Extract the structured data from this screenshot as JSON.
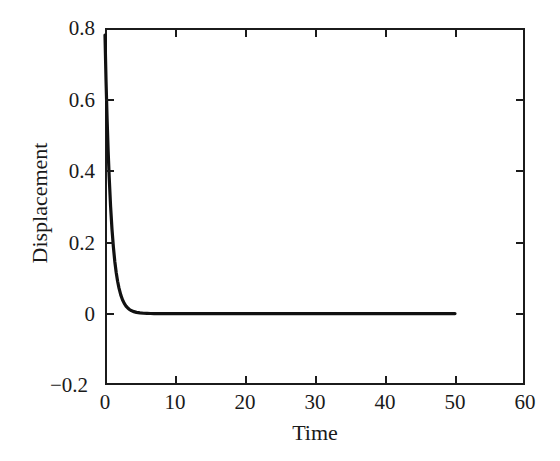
{
  "chart_data": {
    "type": "line",
    "title": "",
    "xlabel": "Time",
    "ylabel": "Displacement",
    "xlim": [
      0,
      60
    ],
    "ylim": [
      -0.2,
      0.8
    ],
    "xticks": [
      0,
      10,
      20,
      30,
      40,
      50,
      60
    ],
    "xticklabels": [
      "0",
      "10",
      "20",
      "30",
      "40",
      "50",
      "60"
    ],
    "yticks": [
      -0.2,
      0,
      0.2,
      0.4,
      0.6,
      0.8
    ],
    "yticklabels": [
      "−0.2",
      "0",
      "0.2",
      "0.4",
      "0.6",
      "0.8"
    ],
    "grid": false,
    "legend": null,
    "line_color": "#111111",
    "line_width": 3.2,
    "background_color": "#ffffff",
    "axis_color": "#1b1b1b",
    "series": [
      {
        "name": "displacement",
        "x": [
          0.0,
          0.15,
          0.3,
          0.45,
          0.6,
          0.8,
          1.0,
          1.2,
          1.4,
          1.6,
          1.8,
          2.0,
          2.25,
          2.5,
          2.75,
          3.0,
          3.25,
          3.5,
          3.75,
          4.0,
          4.5,
          5.0,
          5.5,
          6.0,
          6.5,
          7.0,
          8.0,
          9.0,
          10.0,
          12.0,
          15.0,
          20.0,
          25.0,
          30.0,
          35.0,
          40.0,
          45.0,
          50.0
        ],
        "y": [
          0.78,
          0.65,
          0.545,
          0.455,
          0.382,
          0.3,
          0.236,
          0.186,
          0.146,
          0.115,
          0.0905,
          0.0712,
          0.0525,
          0.0388,
          0.0286,
          0.0211,
          0.0156,
          0.0115,
          0.0085,
          0.0063,
          0.0034,
          0.0019,
          0.001,
          0.00055,
          0.0003,
          0.00016,
          5e-05,
          2e-05,
          1e-05,
          0.0,
          0.0,
          0.0,
          0.0,
          0.0,
          0.0,
          0.0,
          0.0,
          0.0
        ]
      }
    ]
  },
  "axis": {
    "x_tick_labels": [
      "0",
      "10",
      "20",
      "30",
      "40",
      "50",
      "60"
    ],
    "y_tick_labels": [
      "0.8",
      "0.6",
      "0.4",
      "0.2",
      "0",
      "−0.2"
    ],
    "x_title": "Time",
    "y_title": "Displacement"
  }
}
